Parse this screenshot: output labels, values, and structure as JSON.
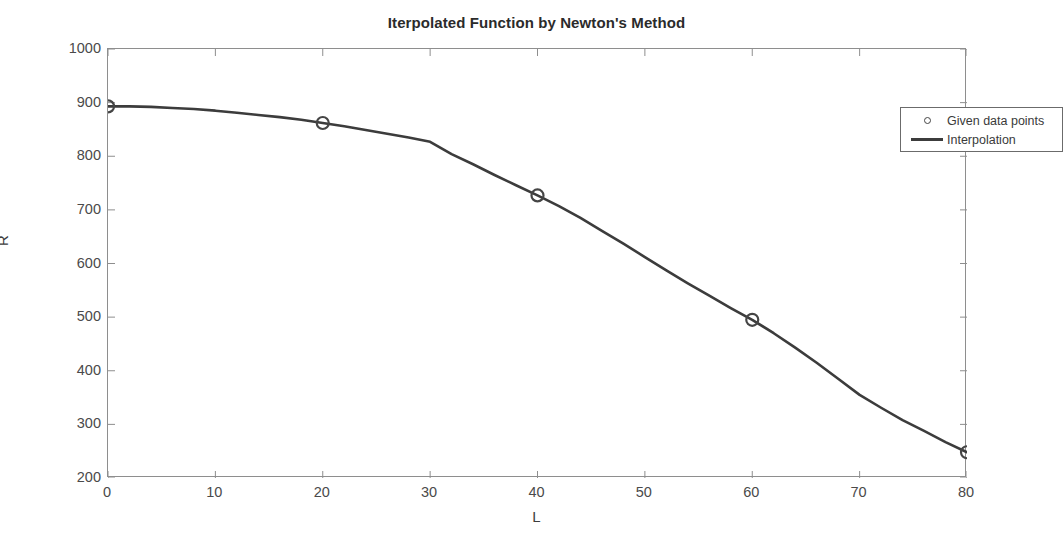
{
  "figure": {
    "background_color": "#ffffff",
    "axis_color": "#8e8e8e",
    "line_color": "#3c3c3c",
    "marker_color": "#454545",
    "text_color": "#3a3a3a"
  },
  "chart_data": {
    "type": "line",
    "title": "Iterpolated Function by Newton's Method",
    "xlabel": "L",
    "ylabel": "R",
    "xlim": [
      0,
      80
    ],
    "ylim": [
      200,
      1000
    ],
    "xticks": [
      0,
      10,
      20,
      30,
      40,
      50,
      60,
      70,
      80
    ],
    "yticks": [
      200,
      300,
      400,
      500,
      600,
      700,
      800,
      900,
      1000
    ],
    "xtick_labels": [
      "0",
      "10",
      "20",
      "30",
      "40",
      "50",
      "60",
      "70",
      "80"
    ],
    "ytick_labels": [
      "200",
      "300",
      "400",
      "500",
      "600",
      "700",
      "800",
      "900",
      "1000"
    ],
    "grid": false,
    "legend_position": "top-right",
    "series": [
      {
        "name": "Given data points",
        "style": "marker",
        "marker": "circle-open",
        "x": [
          0,
          20,
          40,
          60,
          80
        ],
        "y": [
          893,
          862,
          727,
          495,
          248
        ]
      },
      {
        "name": "Interpolation",
        "style": "line",
        "x": [
          0,
          2,
          4,
          6,
          8,
          10,
          12,
          14,
          16,
          18,
          20,
          22,
          24,
          26,
          28,
          30,
          32,
          34,
          36,
          38,
          40,
          42,
          44,
          46,
          48,
          50,
          52,
          54,
          56,
          58,
          60,
          62,
          64,
          66,
          68,
          70,
          72,
          74,
          76,
          78,
          80
        ],
        "y": [
          893,
          893,
          892,
          890,
          888,
          885,
          881,
          877,
          873,
          868,
          862,
          856,
          849,
          842,
          835,
          827,
          804,
          785,
          765,
          746,
          727,
          707,
          685,
          661,
          637,
          612,
          587,
          563,
          540,
          517,
          495,
          470,
          443,
          415,
          385,
          355,
          331,
          308,
          288,
          267,
          248
        ]
      }
    ]
  },
  "legend": {
    "entries": [
      {
        "label": "Given data points",
        "symbol": "circle-open-marker"
      },
      {
        "label": "Interpolation",
        "symbol": "solid-line"
      }
    ]
  }
}
